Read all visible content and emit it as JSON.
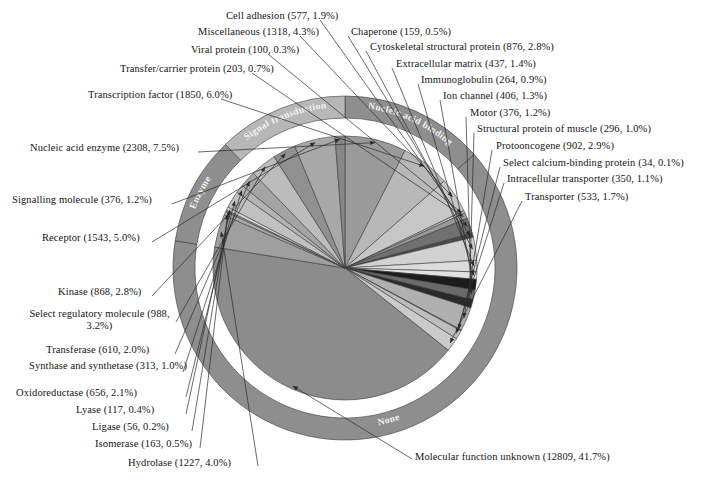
{
  "figure": {
    "title": "",
    "caption_clipped": "",
    "center": {
      "x": 345,
      "y": 268
    },
    "inner_radius": 132,
    "gap_inner": 139,
    "gap_outer": 150,
    "outer_radius": 172,
    "start_angle_deg": -90
  },
  "chart_data": {
    "type": "pie",
    "xlabel": "",
    "ylabel": "",
    "total": 30717,
    "units": "gene count",
    "label_format": "name (count, percent)",
    "categories": [
      "Molecular function unknown",
      "Nucleic acid enzyme",
      "Transcription factor",
      "Receptor",
      "Miscellaneous",
      "Hydrolase",
      "Select regulatory molecule",
      "Protooncogene",
      "Kinase",
      "Cytoskeletal structural protein",
      "Oxidoreductase",
      "Transferase",
      "Cell adhesion",
      "Transporter",
      "Extracellular matrix",
      "Ion channel",
      "Motor",
      "Signalling molecule",
      "Intracellular transporter",
      "Structural protein of muscle",
      "Immunoglobulin",
      "Transfer/carrier protein",
      "Isomerase",
      "Chaperone",
      "Lyase",
      "Viral protein",
      "Ligase",
      "Synthase and synthetase",
      "Select calcium-binding protein"
    ],
    "values": [
      12809,
      2308,
      1850,
      1543,
      1318,
      1227,
      988,
      902,
      868,
      876,
      656,
      610,
      577,
      533,
      437,
      406,
      376,
      376,
      350,
      296,
      264,
      203,
      163,
      159,
      117,
      100,
      56,
      313,
      34
    ],
    "percents": [
      41.7,
      7.5,
      6.0,
      5.0,
      4.3,
      4.0,
      3.2,
      2.9,
      2.8,
      2.8,
      2.1,
      2.0,
      1.9,
      1.7,
      1.4,
      1.3,
      1.2,
      1.2,
      1.1,
      1.0,
      0.9,
      0.7,
      0.5,
      0.5,
      0.4,
      0.3,
      0.2,
      1.0,
      0.1
    ],
    "legend_position": "callout-labels",
    "grid": false
  },
  "slices": [
    {
      "name": "Molecular function unknown",
      "count": 12809,
      "percent": 41.7,
      "color": "#8c8c8c",
      "label": "Molecular function unknown (12809, 41.7%)"
    },
    {
      "name": "Nucleic acid enzyme",
      "count": 2308,
      "percent": 7.5,
      "color": "#9a9a9a",
      "label": "Nucleic acid enzyme (2308, 7.5%)"
    },
    {
      "name": "Transcription factor",
      "count": 1850,
      "percent": 6.0,
      "color": "#b8b8b8",
      "label": "Transcription factor (1850, 6.0%)"
    },
    {
      "name": "Receptor",
      "count": 1543,
      "percent": 5.0,
      "color": "#a8a8a8",
      "label": "Receptor (1543, 5.0%)"
    },
    {
      "name": "Miscellaneous",
      "count": 1318,
      "percent": 4.3,
      "color": "#c6c6c6",
      "label": "Miscellaneous (1318, 4.3%)"
    },
    {
      "name": "Hydrolase",
      "count": 1227,
      "percent": 4.0,
      "color": "#9f9f9f",
      "label": "Hydrolase (1227, 4.0%)"
    },
    {
      "name": "Select regulatory molecule",
      "count": 988,
      "percent": 3.2,
      "color": "#bcbcbc",
      "label": "Select regulatory molecule (988, 3.2%)"
    },
    {
      "name": "Protooncogene",
      "count": 902,
      "percent": 2.9,
      "color": "#b0b0b0",
      "label": "Protooncogene (902, 2.9%)"
    },
    {
      "name": "Cytoskeletal structural protein",
      "count": 876,
      "percent": 2.8,
      "color": "#d2d2d2",
      "label": "Cytoskeletal structural protein (876, 2.8%)"
    },
    {
      "name": "Kinase",
      "count": 868,
      "percent": 2.8,
      "color": "#909090",
      "label": "Kinase (868, 2.8%)"
    },
    {
      "name": "Oxidoreductase",
      "count": 656,
      "percent": 2.1,
      "color": "#c0c0c0",
      "label": "Oxidoreductase (656, 2.1%)"
    },
    {
      "name": "Transferase",
      "count": 610,
      "percent": 2.0,
      "color": "#a4a4a4",
      "label": "Transferase (610, 2.0%)"
    },
    {
      "name": "Cell adhesion",
      "count": 577,
      "percent": 1.9,
      "color": "#707070",
      "label": "Cell adhesion (577, 1.9%)"
    },
    {
      "name": "Transporter",
      "count": 533,
      "percent": 1.7,
      "color": "#cacaca",
      "label": "Transporter (533, 1.7%)"
    },
    {
      "name": "Extracellular matrix",
      "count": 437,
      "percent": 1.4,
      "color": "#dcdcdc",
      "label": "Extracellular matrix (437, 1.4%)"
    },
    {
      "name": "Ion channel",
      "count": 406,
      "percent": 1.3,
      "color": "#1c1c1c",
      "label": "Ion channel (406, 1.3%)"
    },
    {
      "name": "Motor",
      "count": 376,
      "percent": 1.2,
      "color": "#6a6a6a",
      "label": "Motor (376, 1.2%)"
    },
    {
      "name": "Signalling molecule",
      "count": 376,
      "percent": 1.2,
      "color": "#878787",
      "label": "Signalling molecule (376, 1.2%)"
    },
    {
      "name": "Intracellular transporter",
      "count": 350,
      "percent": 1.1,
      "color": "#bdbdbd",
      "label": "Intracellular transporter (350, 1.1%)"
    },
    {
      "name": "Structural protein of muscle",
      "count": 296,
      "percent": 1.0,
      "color": "#2a2a2a",
      "label": "Structural protein of muscle (296, 1.0%)"
    },
    {
      "name": "Immunoglobulin",
      "count": 264,
      "percent": 0.9,
      "color": "#e2e2e2",
      "label": "Immunoglobulin (264, 0.9%)"
    },
    {
      "name": "Transfer/carrier protein",
      "count": 203,
      "percent": 0.7,
      "color": "#989898",
      "label": "Transfer/carrier protein (203, 0.7%)"
    },
    {
      "name": "Isomerase",
      "count": 163,
      "percent": 0.5,
      "color": "#ababab",
      "label": "Isomerase (163, 0.5%)"
    },
    {
      "name": "Chaperone",
      "count": 159,
      "percent": 0.5,
      "color": "#4a4a4a",
      "label": "Chaperone (159, 0.5%)"
    },
    {
      "name": "Lyase",
      "count": 117,
      "percent": 0.4,
      "color": "#d6d6d6",
      "label": "Lyase (117, 0.4%)"
    },
    {
      "name": "Viral protein",
      "count": 100,
      "percent": 0.3,
      "color": "#bfbfbf",
      "label": "Viral protein (100, 0.3%)"
    },
    {
      "name": "Ligase",
      "count": 56,
      "percent": 0.2,
      "color": "#9c9c9c",
      "label": "Ligase (56, 0.2%)"
    },
    {
      "name": "Synthase and synthetase",
      "count": 313,
      "percent": 1.0,
      "color": "#b4b4b4",
      "label": "Synthase and synthetase (313, 1.0%)"
    },
    {
      "name": "Select calcium-binding protein",
      "count": 34,
      "percent": 0.1,
      "color": "#8f8f8f",
      "label": "Select calcium-binding protein (34, 0.1%)"
    }
  ],
  "ring_groups": [
    {
      "name": "None",
      "label": "None",
      "color": "#8e8e8e"
    },
    {
      "name": "Nucleic acid binding",
      "label": "Nucleic acid binding",
      "color": "#8e8e8e"
    },
    {
      "name": "Signal transduction",
      "label": "Signal transduction",
      "color": "#b7b7b7"
    },
    {
      "name": "Enzyme",
      "label": "Enzyme",
      "color": "#8e8e8e"
    }
  ],
  "callouts": [
    {
      "key": "cell_adhesion",
      "text": "Cell adhesion (577, 1.9%)"
    },
    {
      "key": "miscellaneous",
      "text": "Miscellaneous (1318, 4.3%)"
    },
    {
      "key": "viral_protein",
      "text": "Viral protein (100, 0.3%)"
    },
    {
      "key": "transfer_carrier",
      "text": "Transfer/carrier protein (203, 0.7%)"
    },
    {
      "key": "transcription_factor",
      "text": "Transcription factor (1850, 6.0%)"
    },
    {
      "key": "nucleic_acid_enzyme",
      "text": "Nucleic acid enzyme (2308, 7.5%)"
    },
    {
      "key": "signalling_molecule",
      "text": "Signalling molecule (376, 1.2%)"
    },
    {
      "key": "receptor",
      "text": "Receptor (1543, 5.0%)"
    },
    {
      "key": "kinase",
      "text": "Kinase (868, 2.8%)"
    },
    {
      "key": "select_regulatory",
      "text": "Select regulatory molecule (988, 3.2%)"
    },
    {
      "key": "transferase",
      "text": "Transferase (610, 2.0%)"
    },
    {
      "key": "synthase",
      "text": "Synthase and synthetase (313, 1.0%)"
    },
    {
      "key": "oxidoreductase",
      "text": "Oxidoreductase (656, 2.1%)"
    },
    {
      "key": "lyase",
      "text": "Lyase (117, 0.4%)"
    },
    {
      "key": "ligase",
      "text": "Ligase (56, 0.2%)"
    },
    {
      "key": "isomerase",
      "text": "Isomerase (163, 0.5%)"
    },
    {
      "key": "hydrolase",
      "text": "Hydrolase (1227, 4.0%)"
    },
    {
      "key": "molecular_unknown",
      "text": "Molecular function unknown (12809, 41.7%)"
    },
    {
      "key": "chaperone",
      "text": "Chaperone (159, 0.5%)"
    },
    {
      "key": "cytoskeletal",
      "text": "Cytoskeletal structural protein (876, 2.8%)"
    },
    {
      "key": "extracellular_matrix",
      "text": "Extracellular matrix (437, 1.4%)"
    },
    {
      "key": "immunoglobulin",
      "text": "Immunoglobulin (264, 0.9%)"
    },
    {
      "key": "ion_channel",
      "text": "Ion channel (406, 1.3%)"
    },
    {
      "key": "motor",
      "text": "Motor (376, 1.2%)"
    },
    {
      "key": "structural_muscle",
      "text": "Structural protein of muscle (296, 1.0%)"
    },
    {
      "key": "protooncogene",
      "text": "Protooncogene (902, 2.9%)"
    },
    {
      "key": "calcium_binding",
      "text": "Select calcium-binding protein (34, 0.1%)"
    },
    {
      "key": "intracellular_transporter",
      "text": "Intracellular transporter (350, 1.1%)"
    },
    {
      "key": "transporter",
      "text": "Transporter (533, 1.7%)"
    }
  ],
  "callout_text": {
    "cell_adhesion": "Cell adhesion (577, 1.9%)",
    "miscellaneous": "Miscellaneous (1318, 4.3%)",
    "viral_protein": "Viral protein (100, 0.3%)",
    "transfer_carrier": "Transfer/carrier protein (203, 0.7%)",
    "transcription_factor": "Transcription factor (1850, 6.0%)",
    "nucleic_acid_enzyme": "Nucleic acid enzyme (2308, 7.5%)",
    "signalling_molecule": "Signalling molecule (376, 1.2%)",
    "receptor": "Receptor (1543, 5.0%)",
    "kinase": "Kinase (868, 2.8%)",
    "select_regulatory": "Select regulatory molecule (988, 3.2%)",
    "transferase": "Transferase (610, 2.0%)",
    "synthase": "Synthase and synthetase (313, 1.0%)",
    "oxidoreductase": "Oxidoreductase (656, 2.1%)",
    "lyase": "Lyase (117, 0.4%)",
    "ligase": "Ligase (56, 0.2%)",
    "isomerase": "Isomerase (163, 0.5%)",
    "hydrolase": "Hydrolase (1227, 4.0%)",
    "molecular_unknown": "Molecular function unknown (12809, 41.7%)",
    "chaperone": "Chaperone (159, 0.5%)",
    "cytoskeletal": "Cytoskeletal structural protein (876, 2.8%)",
    "extracellular_matrix": "Extracellular matrix (437, 1.4%)",
    "immunoglobulin": "Immunoglobulin (264, 0.9%)",
    "ion_channel": "Ion channel (406, 1.3%)",
    "motor": "Motor (376, 1.2%)",
    "structural_muscle": "Structural protein of muscle (296, 1.0%)",
    "protooncogene": "Protooncogene (902, 2.9%)",
    "calcium_binding": "Select calcium-binding protein (34, 0.1%)",
    "intracellular_transporter": "Intracellular transporter (350, 1.1%)",
    "transporter": "Transporter (533, 1.7%)"
  },
  "colors": {
    "background": "#ffffff",
    "text": "#141414",
    "leader_line": "#2b2b2b",
    "ring_label_text": "#f2f2f2",
    "slice_outline": "#3a3a3a"
  }
}
